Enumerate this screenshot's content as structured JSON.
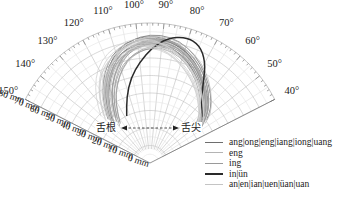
{
  "chart_data": {
    "type": "polar-line",
    "title": "",
    "angular_axis": {
      "ticks": [
        "40°",
        "50°",
        "60°",
        "70°",
        "80°",
        "90°",
        "100°",
        "110°",
        "120°",
        "130°",
        "140°",
        "150°"
      ],
      "range_deg": [
        40,
        150
      ]
    },
    "radial_axis": {
      "ticks": [
        "0 mm",
        "10 mm",
        "20 mm",
        "30 mm",
        "40 mm",
        "50 mm",
        "60 mm",
        "70 mm",
        "80 mm"
      ],
      "range": [
        0,
        80
      ],
      "unit": "mm"
    },
    "annotations": {
      "left": "舌根",
      "right": "舌尖",
      "arrow": "bidirectional dashed"
    },
    "series": [
      {
        "name": "ang|ong|eng|iang|iong|uang",
        "color": "#6e6e6e",
        "width": 1.0,
        "points_deg_mm": [
          [
            132,
            33
          ],
          [
            126,
            43
          ],
          [
            120,
            52
          ],
          [
            114,
            60
          ],
          [
            108,
            66
          ],
          [
            100,
            70
          ],
          [
            92,
            71
          ],
          [
            84,
            69
          ],
          [
            76,
            64
          ],
          [
            68,
            57
          ],
          [
            60,
            50
          ],
          [
            54,
            44
          ],
          [
            50,
            38
          ]
        ]
      },
      {
        "name": "eng",
        "color": "#b4b4b4",
        "width": 1.0,
        "points_deg_mm": [
          [
            130,
            34
          ],
          [
            124,
            45
          ],
          [
            118,
            54
          ],
          [
            112,
            61
          ],
          [
            105,
            67
          ],
          [
            97,
            70
          ],
          [
            89,
            70
          ],
          [
            81,
            67
          ],
          [
            73,
            62
          ],
          [
            65,
            55
          ],
          [
            58,
            48
          ],
          [
            52,
            42
          ],
          [
            49,
            36
          ]
        ]
      },
      {
        "name": "ing",
        "color": "#9a9a9a",
        "width": 1.0,
        "points_deg_mm": [
          [
            128,
            30
          ],
          [
            122,
            41
          ],
          [
            116,
            50
          ],
          [
            110,
            58
          ],
          [
            104,
            64
          ],
          [
            96,
            68
          ],
          [
            88,
            69
          ],
          [
            80,
            66
          ],
          [
            72,
            60
          ],
          [
            64,
            53
          ],
          [
            57,
            46
          ],
          [
            52,
            40
          ],
          [
            48,
            34
          ]
        ]
      },
      {
        "name": "in|ün",
        "color": "#2a2a2a",
        "width": 1.5,
        "points_deg_mm": [
          [
            118,
            30
          ],
          [
            112,
            40
          ],
          [
            106,
            50
          ],
          [
            100,
            58
          ],
          [
            94,
            66
          ],
          [
            88,
            72
          ],
          [
            81,
            75
          ],
          [
            75,
            73
          ],
          [
            70,
            66
          ],
          [
            66,
            56
          ],
          [
            62,
            48
          ],
          [
            57,
            43
          ],
          [
            52,
            40
          ]
        ]
      },
      {
        "name": "an|en|ian|uen|üan|uan",
        "color": "#cfcfcf",
        "width": 1.0,
        "points_deg_mm": [
          [
            134,
            36
          ],
          [
            128,
            46
          ],
          [
            122,
            55
          ],
          [
            116,
            62
          ],
          [
            108,
            67
          ],
          [
            100,
            69
          ],
          [
            92,
            68
          ],
          [
            84,
            64
          ],
          [
            76,
            58
          ],
          [
            68,
            52
          ],
          [
            61,
            46
          ],
          [
            55,
            41
          ],
          [
            50,
            37
          ]
        ]
      }
    ]
  },
  "legend": {
    "items": [
      {
        "label": "ang|ong|eng|iang|iong|uang",
        "color": "#6e6e6e",
        "width": 1
      },
      {
        "label": "eng",
        "color": "#b4b4b4",
        "width": 1
      },
      {
        "label": "ing",
        "color": "#9a9a9a",
        "width": 1
      },
      {
        "label": "in|ün",
        "color": "#2a2a2a",
        "width": 2
      },
      {
        "label": "an|en|ian|uen|üan|uan",
        "color": "#c4c4c4",
        "width": 1
      }
    ]
  },
  "labels": {
    "root": "舌根",
    "tip": "舌尖"
  }
}
